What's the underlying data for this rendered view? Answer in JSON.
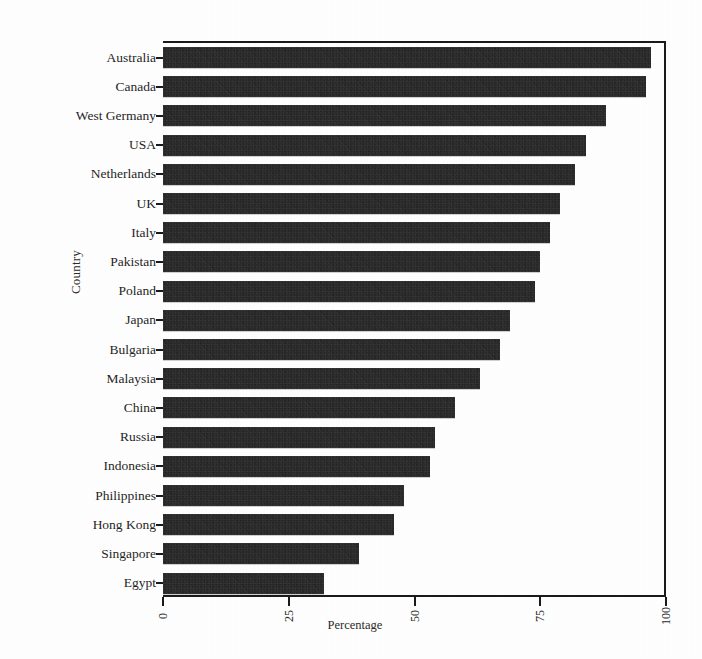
{
  "chart_data": {
    "type": "bar",
    "orientation": "horizontal",
    "title": "",
    "xlabel": "Percentage",
    "ylabel": "Country",
    "xlim": [
      0,
      100
    ],
    "xticks": [
      "0",
      "25",
      "50",
      "75",
      "100"
    ],
    "xtick_values": [
      0,
      25,
      50,
      75,
      100
    ],
    "grid": false,
    "legend": null,
    "bar_color": "#1c1c1c",
    "categories": [
      "Australia",
      "Canada",
      "West Germany",
      "USA",
      "Netherlands",
      "UK",
      "Italy",
      "Pakistan",
      "Poland",
      "Japan",
      "Bulgaria",
      "Malaysia",
      "China",
      "Russia",
      "Indonesia",
      "Philippines",
      "Hong Kong",
      "Singapore",
      "Egypt"
    ],
    "values": [
      97,
      96,
      88,
      84,
      82,
      79,
      77,
      75,
      74,
      69,
      67,
      63,
      58,
      54,
      53,
      48,
      46,
      39,
      32
    ]
  }
}
